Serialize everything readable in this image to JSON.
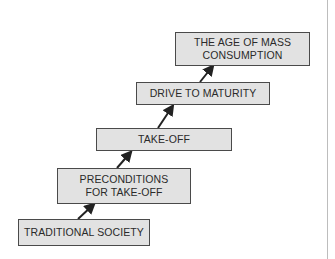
{
  "diagram": {
    "type": "staircase",
    "stages": [
      {
        "label": "TRADITIONAL SOCIETY"
      },
      {
        "label": "PRECONDITIONS FOR TAKE-OFF",
        "line1": "PRECONDITIONS",
        "line2": "FOR TAKE-OFF"
      },
      {
        "label": "TAKE-OFF"
      },
      {
        "label": "DRIVE TO MATURITY"
      },
      {
        "label": "THE AGE OF MASS CONSUMPTION",
        "line1": "THE AGE OF MASS",
        "line2": "CONSUMPTION"
      }
    ],
    "colors": {
      "box_fill": "#e2e2e2",
      "box_border": "#4a4a4a",
      "arrow": "#222222"
    }
  }
}
